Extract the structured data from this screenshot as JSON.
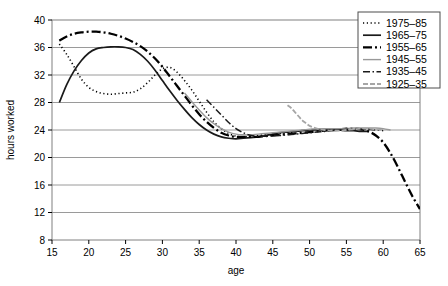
{
  "chart_data": {
    "type": "line",
    "title": "",
    "xlabel": "age",
    "ylabel": "hours worked",
    "xlim": [
      15,
      65
    ],
    "ylim": [
      8,
      40
    ],
    "xticks": [
      15,
      20,
      25,
      30,
      35,
      40,
      45,
      50,
      55,
      60,
      65
    ],
    "yticks": [
      8,
      12,
      16,
      20,
      24,
      28,
      32,
      36,
      40
    ],
    "grid": "horizontal",
    "legend_position": "top-right",
    "series": [
      {
        "name": "1975–85",
        "style": "dotted",
        "color": "#000000",
        "width": 1.6,
        "dash": "1.2,2.6",
        "x": [
          16,
          17,
          18,
          19,
          20,
          21,
          22,
          23,
          24,
          25,
          26,
          27,
          28,
          29,
          30,
          31,
          32,
          33,
          34,
          35,
          36,
          37,
          38,
          39,
          40,
          41,
          42,
          43,
          44,
          45,
          46,
          47,
          48
        ],
        "y": [
          36.5,
          35.0,
          33.2,
          31.4,
          30.2,
          29.6,
          29.3,
          29.2,
          29.3,
          29.4,
          29.5,
          30.0,
          30.9,
          32.0,
          32.9,
          33.1,
          32.4,
          31.2,
          29.8,
          28.2,
          26.6,
          25.2,
          24.2,
          23.5,
          23.1,
          23.0,
          23.1,
          23.2,
          23.3,
          23.4,
          23.5,
          23.6,
          23.6
        ]
      },
      {
        "name": "1965–75",
        "style": "solid",
        "color": "#1a1a1a",
        "width": 1.7,
        "dash": "",
        "x": [
          16,
          17,
          18,
          19,
          20,
          21,
          22,
          23,
          24,
          25,
          26,
          27,
          28,
          29,
          30,
          31,
          32,
          33,
          34,
          35,
          36,
          37,
          38,
          39,
          40,
          41,
          42,
          43,
          44,
          45,
          46,
          47,
          48,
          49,
          50,
          51,
          52,
          53,
          54,
          55,
          56,
          57,
          58
        ],
        "y": [
          28.0,
          30.6,
          32.6,
          34.1,
          35.2,
          35.8,
          36.0,
          36.1,
          36.1,
          36.0,
          35.7,
          35.0,
          34.0,
          32.7,
          31.2,
          29.7,
          28.3,
          27.0,
          25.8,
          24.8,
          24.0,
          23.4,
          23.0,
          22.8,
          22.7,
          22.8,
          22.9,
          23.0,
          23.2,
          23.4,
          23.6,
          23.7,
          23.8,
          23.9,
          24.0,
          24.0,
          24.0,
          24.0,
          24.0,
          23.9,
          23.9,
          23.8,
          23.8
        ]
      },
      {
        "name": "1955–65",
        "style": "dash-dot",
        "color": "#000000",
        "width": 2.3,
        "dash": "9,3,2,3",
        "x": [
          16,
          17,
          18,
          19,
          20,
          21,
          22,
          23,
          24,
          25,
          26,
          27,
          28,
          29,
          30,
          31,
          32,
          33,
          34,
          35,
          36,
          37,
          38,
          39,
          40,
          41,
          42,
          43,
          44,
          45,
          46,
          47,
          48,
          49,
          50,
          51,
          52,
          53,
          54,
          55,
          56,
          57,
          58,
          59,
          60,
          61,
          62,
          63,
          64,
          65
        ],
        "y": [
          37.0,
          37.6,
          38.0,
          38.2,
          38.3,
          38.3,
          38.2,
          38.0,
          37.7,
          37.3,
          36.8,
          36.2,
          35.4,
          34.4,
          33.2,
          31.8,
          30.4,
          29.0,
          27.6,
          26.3,
          25.2,
          24.3,
          23.6,
          23.2,
          23.0,
          23.0,
          23.0,
          23.0,
          23.1,
          23.2,
          23.3,
          23.4,
          23.5,
          23.6,
          23.7,
          23.8,
          23.9,
          24.0,
          24.1,
          24.2,
          24.2,
          24.1,
          23.8,
          23.2,
          22.2,
          20.6,
          18.6,
          16.4,
          14.3,
          12.5
        ]
      },
      {
        "name": "1945–55",
        "style": "solid-gray",
        "color": "#999999",
        "width": 1.4,
        "dash": "",
        "x": [
          33,
          34,
          35,
          36,
          37,
          38,
          39,
          40,
          41,
          42,
          43,
          44,
          45,
          46,
          47,
          48,
          49,
          50,
          51,
          52,
          53,
          54,
          55,
          56,
          57,
          58,
          59,
          60,
          61
        ],
        "y": [
          29.4,
          28.1,
          26.9,
          25.8,
          24.9,
          24.2,
          23.7,
          23.4,
          23.3,
          23.3,
          23.4,
          23.5,
          23.6,
          23.7,
          23.8,
          23.9,
          24.0,
          24.1,
          24.2,
          24.2,
          24.2,
          24.2,
          24.2,
          24.3,
          24.3,
          24.3,
          24.3,
          24.2,
          24.0
        ]
      },
      {
        "name": "1935–45",
        "style": "dash-dot-thin",
        "color": "#1a1a1a",
        "width": 1.5,
        "dash": "7,2.5,1.5,2.5",
        "x": [
          36,
          37,
          38,
          39,
          40,
          41,
          42,
          43,
          44,
          45,
          46,
          47,
          48,
          49,
          50,
          51,
          52,
          53,
          54,
          55,
          56,
          57,
          58,
          59,
          60
        ],
        "y": [
          28.4,
          27.3,
          26.2,
          25.1,
          24.2,
          23.6,
          23.2,
          23.1,
          23.1,
          23.2,
          23.2,
          23.3,
          23.4,
          23.5,
          23.6,
          23.7,
          23.8,
          23.9,
          24.0,
          24.1,
          24.1,
          24.1,
          24.1,
          24.0,
          23.9
        ]
      },
      {
        "name": "1925–35",
        "style": "dashed-gray",
        "color": "#a6a6a6",
        "width": 1.8,
        "dash": "5,2",
        "x": [
          47,
          47.5,
          48,
          48.5,
          49,
          49.5,
          50,
          51,
          52,
          53,
          54,
          55,
          56,
          57,
          58,
          59,
          60
        ],
        "y": [
          27.6,
          27.2,
          26.6,
          26.0,
          25.4,
          25.0,
          24.6,
          24.2,
          24.0,
          23.9,
          23.9,
          24.0,
          24.1,
          24.2,
          24.2,
          24.1,
          24.0
        ]
      }
    ]
  },
  "legend": {
    "items": [
      {
        "label": "1975–85"
      },
      {
        "label": "1965–75"
      },
      {
        "label": "1955–65"
      },
      {
        "label": "1945–55"
      },
      {
        "label": "1935–45"
      },
      {
        "label": "1925–35"
      }
    ]
  }
}
